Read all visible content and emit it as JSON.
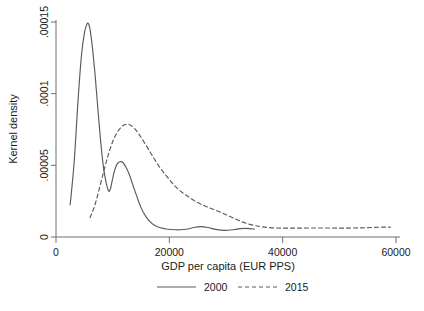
{
  "chart_data": {
    "type": "line",
    "title": "",
    "xlabel": "GDP per capita (EUR PPS)",
    "ylabel": "Kernel density",
    "xlim": [
      0,
      60000
    ],
    "ylim": [
      0,
      0.00015
    ],
    "xticks": [
      0,
      20000,
      40000,
      60000
    ],
    "xtick_labels": [
      "0",
      "20000",
      "40000",
      "60000"
    ],
    "yticks": [
      0,
      5e-05,
      0.0001,
      0.00015
    ],
    "ytick_labels": [
      "0",
      ".00005",
      ".0001",
      ".00015"
    ],
    "grid": false,
    "legend_position": "bottom",
    "series": [
      {
        "name": "2000",
        "style": "solid",
        "color": "#5a5a5a",
        "x": [
          2500,
          3200,
          3900,
          4500,
          5000,
          5400,
          5700,
          6000,
          6400,
          6900,
          7400,
          7900,
          8400,
          8900,
          9300,
          9600,
          9900,
          10300,
          10800,
          11300,
          11800,
          12300,
          12900,
          13500,
          14200,
          15000,
          15900,
          16900,
          18000,
          19200,
          20400,
          21500,
          22500,
          23500,
          24500,
          25600,
          26800,
          28000,
          29200,
          30400,
          31500,
          32500,
          33500,
          34300,
          35000
        ],
        "y": [
          2.25e-05,
          5.2e-05,
          9.6e-05,
          0.000127,
          0.000142,
          0.000148,
          0.000149,
          0.000145,
          0.000133,
          0.000113,
          8.9e-05,
          6.6e-05,
          4.8e-05,
          3.7e-05,
          3.2e-05,
          3.35e-05,
          3.9e-05,
          4.6e-05,
          5.1e-05,
          5.25e-05,
          5.2e-05,
          4.9e-05,
          4.4e-05,
          3.7e-05,
          2.9e-05,
          2.05e-05,
          1.4e-05,
          9.5e-06,
          7e-06,
          5.8e-06,
          5.2e-06,
          5e-06,
          5.2e-06,
          5.8e-06,
          6.8e-06,
          7.2e-06,
          6.6e-06,
          5.5e-06,
          4.8e-06,
          4.7e-06,
          5.2e-06,
          5.8e-06,
          6e-06,
          5.8e-06,
          5.5e-06
        ]
      },
      {
        "name": "2015",
        "style": "dashed",
        "color": "#5a5a5a",
        "x": [
          6000,
          6800,
          7600,
          8400,
          9200,
          10000,
          10800,
          11600,
          12300,
          13000,
          13800,
          14600,
          15500,
          16500,
          17500,
          18600,
          19800,
          21000,
          22300,
          23600,
          25000,
          26400,
          27800,
          29200,
          30600,
          32000,
          33400,
          34800,
          36200,
          37600,
          39000,
          40500,
          42000,
          43500,
          45000,
          46500,
          48000,
          49500,
          51000,
          52500,
          54000,
          55500,
          57000,
          58200,
          59000
        ],
        "y": [
          1.35e-05,
          2.15e-05,
          3.3e-05,
          4.55e-05,
          5.7e-05,
          6.65e-05,
          7.3e-05,
          7.7e-05,
          7.85e-05,
          7.83e-05,
          7.6e-05,
          7.2e-05,
          6.65e-05,
          6e-05,
          5.35e-05,
          4.7e-05,
          4.1e-05,
          3.55e-05,
          3.1e-05,
          2.75e-05,
          2.4e-05,
          2.15e-05,
          1.92e-05,
          1.7e-05,
          1.45e-05,
          1.2e-05,
          9.8e-06,
          8.2e-06,
          7.2e-06,
          6.6e-06,
          6.3e-06,
          6.2e-06,
          6.2e-06,
          6.2e-06,
          6.3e-06,
          6.3e-06,
          6.3e-06,
          6.2e-06,
          6.2e-06,
          6.3e-06,
          6.4e-06,
          6.6e-06,
          6.8e-06,
          6.9e-06,
          6.9e-06
        ]
      }
    ],
    "legend": [
      {
        "label": "2000",
        "style": "solid"
      },
      {
        "label": "2015",
        "style": "dashed"
      }
    ]
  }
}
